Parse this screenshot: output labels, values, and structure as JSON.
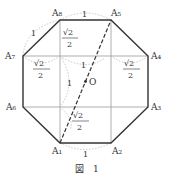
{
  "figure": {
    "caption": "図　1",
    "vertices": {
      "A1": "A₁",
      "A2": "A₂",
      "A3": "A₃",
      "A4": "A₄",
      "A5": "A₅",
      "A6": "A₆",
      "A7": "A₇",
      "A8": "A₈"
    },
    "center_label": "O",
    "side_label": "1",
    "half_sqrt2_num": "√2",
    "half_sqrt2_den": "2",
    "colors": {
      "stroke": "#333333",
      "thin": "#999999",
      "arc": "#bbbbbb"
    }
  }
}
